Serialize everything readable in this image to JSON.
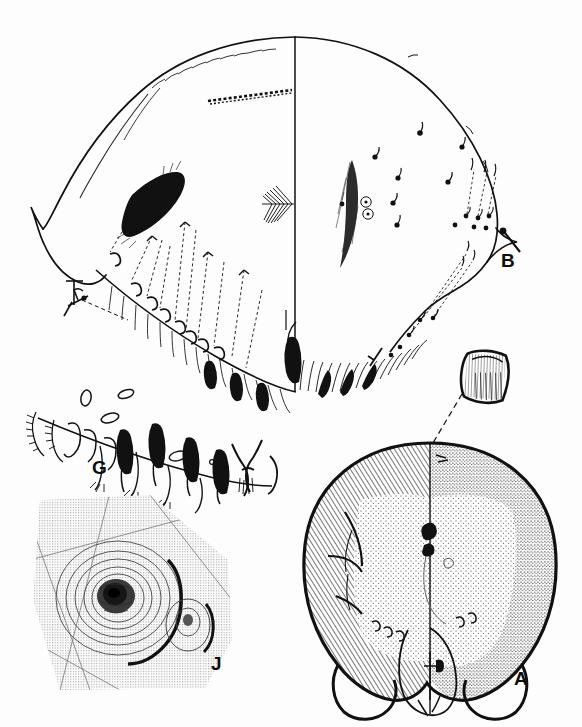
{
  "figure": {
    "kind": "scientific-illustration-plate",
    "technique": "pen-and-ink line drawing",
    "background_color": "#fdfdfd",
    "ink_color": "#0d0d0d",
    "width_px": 582,
    "height_px": 727,
    "panel_count": 4
  },
  "panels": [
    {
      "id": "B",
      "label": "B",
      "label_x": 501,
      "label_y": 251,
      "description": "Large dorsal idiosoma outline, split along the midline; left half shows setae with dashed leader lines, right half shows pore/lyrifissure pattern",
      "features": [
        "vertical midline axis",
        "dark lanceolate sclerite left of midline",
        "dashed leader lines to setal bases",
        "dotted punctation field right of midline",
        "two small circled structures on right half",
        "pectinate (comb-like) seta on midline",
        "marginal spur setae at both lateral margins",
        "dense marginal seta fringe along ventral edge"
      ]
    },
    {
      "id": "G",
      "label": "G",
      "label_x": 92,
      "label_y": 458,
      "description": "Row of isolated setae and sensilla drawn in profile as a comparative series",
      "features": [
        "clavate (club-shaped) setae",
        "barbed / pectinate setae",
        "solenidia outlines",
        "paired forked terminal structure",
        "small circular pore"
      ]
    },
    {
      "id": "J",
      "label": "J",
      "label_x": 211,
      "label_y": 654,
      "description": "Stippled close-up of a concentric ringed organ with an adjacent smaller oval structure",
      "features": [
        "concentric rings around a dark central depression",
        "heavy stipple shading field",
        "smaller secondary oval organ to the lower right",
        "faint linear cuticular striae crossing the field"
      ]
    },
    {
      "id": "A",
      "label": "A",
      "label_x": 514,
      "label_y": 669,
      "description": "Whole-body dorsal habitus, split along the midline; left half hatched/shaded, right half stippled, with paired posterior lobes",
      "features": [
        "vertical midline axis",
        "hatched shading on left half",
        "dotted punctation on right half",
        "two rounded posterior lobes",
        "central genital/anal region between lobes",
        "dashed leader line running up to the inset detail",
        "heavy black outline"
      ]
    }
  ],
  "inset": {
    "id": "inset-detail",
    "description": "Small enlarged detail of a hatched rectangular plate, connected to panel A by a long dashed leader line",
    "x": 455,
    "y": 350,
    "connected_to": "A"
  },
  "labels_all": [
    "A",
    "B",
    "G",
    "J"
  ]
}
